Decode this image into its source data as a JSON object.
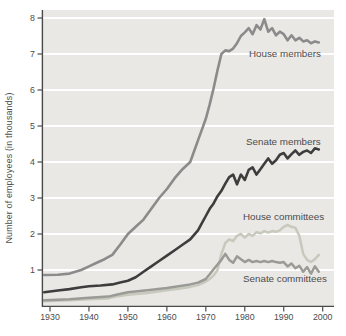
{
  "chart_data": {
    "type": "line",
    "title": "",
    "xlabel": "",
    "ylabel": "Number of employees (in thousands)",
    "x_ticks": [
      1930,
      1940,
      1950,
      1960,
      1970,
      1980,
      1990,
      2000
    ],
    "y_ticks": [
      1,
      2,
      3,
      4,
      5,
      6,
      7,
      8
    ],
    "xlim": [
      1928,
      2002
    ],
    "ylim": [
      0,
      8.2
    ],
    "grid": "horizontal white gridlines on gray panel",
    "legend": "inline labels next to each line",
    "colors": {
      "panel": "#e9e8e5",
      "grid": "#ffffff",
      "axis": "#4a4a4a",
      "text": "#4c4c4c"
    },
    "annotations": [
      {
        "text": "House members",
        "x": 249,
        "y": 57
      },
      {
        "text": "Senate members",
        "x": 246,
        "y": 145
      },
      {
        "text": "House committees",
        "x": 243,
        "y": 220
      },
      {
        "text": "Senate committees",
        "x": 243,
        "y": 282
      }
    ],
    "series": [
      {
        "name": "House committees",
        "color": "#c7c9bd",
        "points": [
          [
            1928.5,
            0.13
          ],
          [
            1935,
            0.16
          ],
          [
            1940,
            0.19
          ],
          [
            1945,
            0.21
          ],
          [
            1947,
            0.26
          ],
          [
            1950,
            0.31
          ],
          [
            1955,
            0.36
          ],
          [
            1960,
            0.44
          ],
          [
            1963,
            0.48
          ],
          [
            1966,
            0.53
          ],
          [
            1968,
            0.58
          ],
          [
            1970,
            0.68
          ],
          [
            1971,
            0.75
          ],
          [
            1972,
            0.85
          ],
          [
            1973,
            1.0
          ],
          [
            1974,
            1.45
          ],
          [
            1975,
            1.75
          ],
          [
            1976,
            1.85
          ],
          [
            1977,
            1.8
          ],
          [
            1978,
            1.95
          ],
          [
            1979,
            2.0
          ],
          [
            1980,
            1.9
          ],
          [
            1981,
            2.0
          ],
          [
            1982,
            1.95
          ],
          [
            1983,
            2.05
          ],
          [
            1984,
            2.02
          ],
          [
            1985,
            2.08
          ],
          [
            1986,
            2.04
          ],
          [
            1987,
            2.08
          ],
          [
            1988,
            2.06
          ],
          [
            1989,
            2.1
          ],
          [
            1990,
            2.2
          ],
          [
            1991,
            2.25
          ],
          [
            1992,
            2.2
          ],
          [
            1993,
            2.17
          ],
          [
            1994,
            1.95
          ],
          [
            1995,
            1.45
          ],
          [
            1996,
            1.28
          ],
          [
            1997,
            1.22
          ],
          [
            1998,
            1.3
          ],
          [
            1999,
            1.42
          ]
        ]
      },
      {
        "name": "Senate committees",
        "color": "#9a9a96",
        "points": [
          [
            1928.5,
            0.16
          ],
          [
            1935,
            0.19
          ],
          [
            1940,
            0.23
          ],
          [
            1945,
            0.26
          ],
          [
            1947,
            0.31
          ],
          [
            1950,
            0.38
          ],
          [
            1955,
            0.44
          ],
          [
            1960,
            0.5
          ],
          [
            1963,
            0.55
          ],
          [
            1966,
            0.6
          ],
          [
            1968,
            0.65
          ],
          [
            1970,
            0.75
          ],
          [
            1971,
            0.88
          ],
          [
            1972,
            1.02
          ],
          [
            1973,
            1.15
          ],
          [
            1974,
            1.28
          ],
          [
            1975,
            1.45
          ],
          [
            1976,
            1.28
          ],
          [
            1977,
            1.2
          ],
          [
            1978,
            1.38
          ],
          [
            1979,
            1.3
          ],
          [
            1980,
            1.22
          ],
          [
            1981,
            1.28
          ],
          [
            1982,
            1.22
          ],
          [
            1983,
            1.25
          ],
          [
            1984,
            1.22
          ],
          [
            1985,
            1.25
          ],
          [
            1986,
            1.22
          ],
          [
            1987,
            1.25
          ],
          [
            1988,
            1.22
          ],
          [
            1989,
            1.2
          ],
          [
            1990,
            1.22
          ],
          [
            1991,
            1.1
          ],
          [
            1992,
            1.18
          ],
          [
            1993,
            1.05
          ],
          [
            1994,
            1.12
          ],
          [
            1995,
            0.95
          ],
          [
            1996,
            1.08
          ],
          [
            1997,
            0.9
          ],
          [
            1998,
            1.1
          ],
          [
            1999,
            0.95
          ]
        ]
      },
      {
        "name": "House members",
        "color": "#8b8b8b",
        "points": [
          [
            1928.5,
            0.86
          ],
          [
            1932,
            0.87
          ],
          [
            1935,
            0.9
          ],
          [
            1938,
            1.0
          ],
          [
            1940,
            1.1
          ],
          [
            1942,
            1.2
          ],
          [
            1944,
            1.3
          ],
          [
            1946,
            1.42
          ],
          [
            1948,
            1.7
          ],
          [
            1950,
            2.0
          ],
          [
            1952,
            2.2
          ],
          [
            1954,
            2.4
          ],
          [
            1956,
            2.7
          ],
          [
            1958,
            3.0
          ],
          [
            1960,
            3.25
          ],
          [
            1962,
            3.55
          ],
          [
            1964,
            3.8
          ],
          [
            1966,
            4.0
          ],
          [
            1967,
            4.3
          ],
          [
            1968,
            4.6
          ],
          [
            1969,
            4.9
          ],
          [
            1970,
            5.2
          ],
          [
            1971,
            5.6
          ],
          [
            1972,
            6.05
          ],
          [
            1973,
            6.55
          ],
          [
            1974,
            7.0
          ],
          [
            1975,
            7.1
          ],
          [
            1976,
            7.08
          ],
          [
            1977,
            7.15
          ],
          [
            1978,
            7.3
          ],
          [
            1979,
            7.5
          ],
          [
            1980,
            7.6
          ],
          [
            1981,
            7.72
          ],
          [
            1982,
            7.55
          ],
          [
            1983,
            7.8
          ],
          [
            1984,
            7.68
          ],
          [
            1985,
            7.97
          ],
          [
            1986,
            7.62
          ],
          [
            1987,
            7.72
          ],
          [
            1988,
            7.52
          ],
          [
            1989,
            7.62
          ],
          [
            1990,
            7.55
          ],
          [
            1991,
            7.38
          ],
          [
            1992,
            7.52
          ],
          [
            1993,
            7.38
          ],
          [
            1994,
            7.45
          ],
          [
            1995,
            7.35
          ],
          [
            1996,
            7.38
          ],
          [
            1997,
            7.3
          ],
          [
            1998,
            7.35
          ],
          [
            1999,
            7.32
          ]
        ]
      },
      {
        "name": "Senate members",
        "color": "#3d3d3d",
        "points": [
          [
            1928.5,
            0.38
          ],
          [
            1932,
            0.43
          ],
          [
            1935,
            0.47
          ],
          [
            1938,
            0.52
          ],
          [
            1940,
            0.55
          ],
          [
            1943,
            0.57
          ],
          [
            1946,
            0.6
          ],
          [
            1948,
            0.65
          ],
          [
            1950,
            0.7
          ],
          [
            1952,
            0.8
          ],
          [
            1954,
            0.95
          ],
          [
            1956,
            1.1
          ],
          [
            1958,
            1.25
          ],
          [
            1960,
            1.4
          ],
          [
            1962,
            1.55
          ],
          [
            1964,
            1.7
          ],
          [
            1966,
            1.85
          ],
          [
            1968,
            2.1
          ],
          [
            1969,
            2.3
          ],
          [
            1970,
            2.5
          ],
          [
            1971,
            2.7
          ],
          [
            1972,
            2.85
          ],
          [
            1973,
            3.05
          ],
          [
            1974,
            3.2
          ],
          [
            1975,
            3.4
          ],
          [
            1976,
            3.58
          ],
          [
            1977,
            3.65
          ],
          [
            1978,
            3.38
          ],
          [
            1979,
            3.65
          ],
          [
            1980,
            3.5
          ],
          [
            1981,
            3.78
          ],
          [
            1982,
            3.85
          ],
          [
            1983,
            3.65
          ],
          [
            1984,
            3.8
          ],
          [
            1985,
            3.95
          ],
          [
            1986,
            4.1
          ],
          [
            1987,
            3.95
          ],
          [
            1988,
            4.05
          ],
          [
            1989,
            4.2
          ],
          [
            1990,
            4.25
          ],
          [
            1991,
            4.1
          ],
          [
            1992,
            4.22
          ],
          [
            1993,
            4.32
          ],
          [
            1994,
            4.2
          ],
          [
            1995,
            4.28
          ],
          [
            1996,
            4.32
          ],
          [
            1997,
            4.25
          ],
          [
            1998,
            4.38
          ],
          [
            1999,
            4.35
          ]
        ]
      }
    ]
  }
}
